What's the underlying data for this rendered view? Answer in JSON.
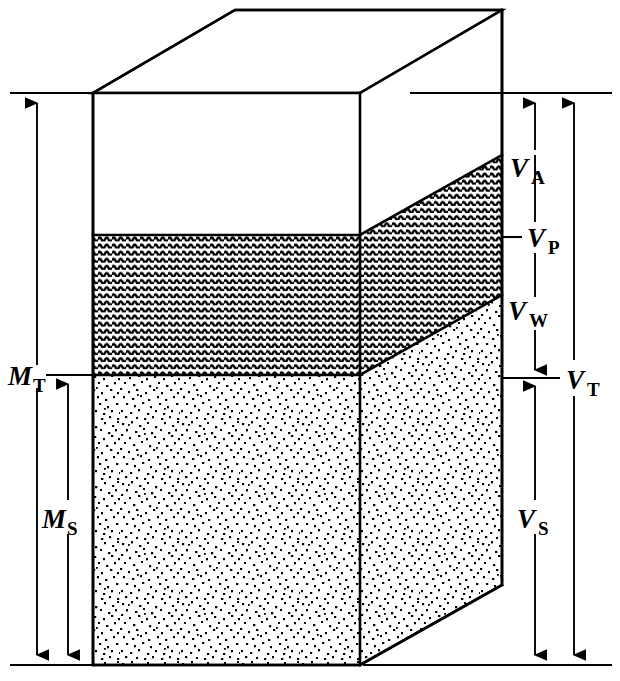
{
  "figure": {
    "background_color": "#ffffff",
    "line_color": "#000000"
  },
  "phases": [
    {
      "id": "air",
      "name": "air",
      "fill": "white",
      "pattern": "none"
    },
    {
      "id": "water",
      "name": "water",
      "fill": "#2b2b2b",
      "pattern": "wavy-horizontal-lines"
    },
    {
      "id": "solids",
      "name": "solids",
      "fill": "#111111",
      "pattern": "random-stipple"
    }
  ],
  "volume_labels": {
    "air": {
      "symbol": "V",
      "subscript": "A",
      "text": "VA"
    },
    "pores": {
      "symbol": "V",
      "subscript": "P",
      "text": "VP"
    },
    "water": {
      "symbol": "V",
      "subscript": "W",
      "text": "VW"
    },
    "total": {
      "symbol": "V",
      "subscript": "T",
      "text": "VT"
    },
    "solids": {
      "symbol": "V",
      "subscript": "S",
      "text": "VS"
    }
  },
  "mass_labels": {
    "total": {
      "symbol": "M",
      "subscript": "T",
      "text": "MT"
    },
    "solids": {
      "symbol": "M",
      "subscript": "S",
      "text": "MS"
    }
  },
  "dimension_chains": {
    "left": [
      {
        "id": "mass-total",
        "label": "MT",
        "span": "top-of-box to bottom-of-box"
      },
      {
        "id": "mass-solids",
        "label": "MS",
        "span": "water/solids interface to bottom-of-box"
      }
    ],
    "right": [
      {
        "id": "volume-air",
        "label": "VA",
        "span": "top-of-box to air/water interface"
      },
      {
        "id": "volume-pores",
        "label": "VP",
        "span": "top-of-box to water/solids interface"
      },
      {
        "id": "volume-water",
        "label": "VW",
        "span": "air/water interface to water/solids interface"
      },
      {
        "id": "volume-solids",
        "label": "VS",
        "span": "water/solids interface to bottom-of-box"
      },
      {
        "id": "volume-total",
        "label": "VT",
        "span": "top-of-box to bottom-of-box"
      }
    ]
  }
}
